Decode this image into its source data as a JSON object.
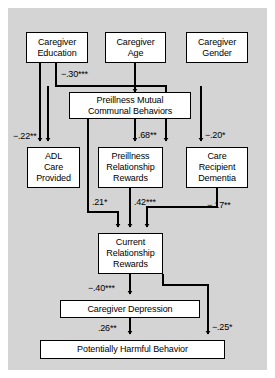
{
  "figure": {
    "type": "path-diagram",
    "background": "#d4d4d4",
    "node_fill": "#ffffff",
    "stroke": "#000000"
  },
  "nodes": {
    "caregiver_education": {
      "line1": "Caregiver",
      "line2": "Education"
    },
    "caregiver_age": {
      "line1": "Caregiver",
      "line2": "Age"
    },
    "caregiver_gender": {
      "line1": "Caregiver",
      "line2": "Gender"
    },
    "preillness_mutual": {
      "line1": "Preillness Mutual",
      "line2": "Communal Behaviors"
    },
    "adl_care": {
      "line1": "ADL",
      "line2": "Care",
      "line3": "Provided"
    },
    "preillness_rewards": {
      "line1": "Preillness",
      "line2": "Relationship",
      "line3": "Rewards"
    },
    "care_recipient_dementia": {
      "line1": "Care",
      "line2": "Recipient",
      "line3": "Dementia"
    },
    "current_rewards": {
      "line1": "Current",
      "line2": "Relationship",
      "line3": "Rewards"
    },
    "caregiver_depression": {
      "line1": "Caregiver Depression"
    },
    "harmful_behavior": {
      "line1": "Potentially Harmful Behavior"
    }
  },
  "paths": [
    {
      "id": "edu-to-mutual",
      "from": "caregiver_education",
      "to": "preillness_mutual",
      "coefficient": "−.30***"
    },
    {
      "id": "edu-to-adl",
      "from": "caregiver_education",
      "to": "adl_care",
      "coefficient": "−.22**"
    },
    {
      "id": "age-to-mutual",
      "from": "caregiver_age",
      "to": "preillness_mutual",
      "coefficient": ""
    },
    {
      "id": "mutual-to-preillness-rewards",
      "from": "preillness_mutual",
      "to": "preillness_rewards",
      "coefficient": ".68**"
    },
    {
      "id": "mutual-to-dementia",
      "from": "preillness_mutual",
      "to": "care_recipient_dementia",
      "coefficient": "−.20*"
    },
    {
      "id": "mutual-to-current-rewards",
      "from": "preillness_mutual",
      "to": "current_rewards",
      "coefficient": ".21*"
    },
    {
      "id": "preillness-rewards-to-current",
      "from": "preillness_rewards",
      "to": "current_rewards",
      "coefficient": ".42***"
    },
    {
      "id": "dementia-to-current",
      "from": "care_recipient_dementia",
      "to": "current_rewards",
      "coefficient": "−.17**"
    },
    {
      "id": "current-to-depression",
      "from": "current_rewards",
      "to": "caregiver_depression",
      "coefficient": "−.40***"
    },
    {
      "id": "depression-to-harmful",
      "from": "caregiver_depression",
      "to": "harmful_behavior",
      "coefficient": ".26**"
    },
    {
      "id": "current-to-harmful",
      "from": "current_rewards",
      "to": "harmful_behavior",
      "coefficient": "−.25*"
    }
  ],
  "coefficient_labels": {
    "edu_mutual": "−.30***",
    "edu_adl": "−.22**",
    "mutual_preillness_rewards": ".68**",
    "mutual_dementia": "−.20*",
    "mutual_current": ".21*",
    "preillness_current": ".42***",
    "dementia_current": "−.17**",
    "current_depression": "−.40***",
    "depression_harmful": ".26**",
    "current_harmful": "−.25*"
  }
}
